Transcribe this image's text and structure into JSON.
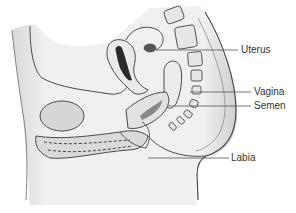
{
  "figure": {
    "labels": [
      {
        "id": "uterus",
        "text": "Uterus"
      },
      {
        "id": "vagina",
        "text": "Vagina"
      },
      {
        "id": "semen",
        "text": "Semen"
      },
      {
        "id": "labia",
        "text": "Labia"
      }
    ]
  },
  "colors": {
    "background": "#ffffff",
    "outline": "#4a4a4a",
    "tissue_fill": "#ededed",
    "shadow": "#c8c8c8",
    "dark_cavity": "#2a2a2a",
    "label_text": "#333333"
  }
}
